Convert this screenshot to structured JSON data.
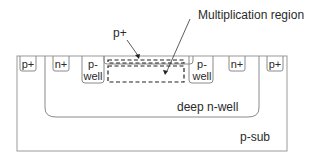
{
  "diagram": {
    "title_annotation": "Multiplication region",
    "top_p_plus_label": "p+",
    "regions": [
      {
        "id": "left-p-plus",
        "label": "p+"
      },
      {
        "id": "left-n-plus",
        "label": "n+"
      },
      {
        "id": "left-p-well",
        "label_line1": "p-",
        "label_line2": "well"
      },
      {
        "id": "right-p-well",
        "label_line1": "p-",
        "label_line2": "well"
      },
      {
        "id": "right-n-plus",
        "label": "n+"
      },
      {
        "id": "right-p-plus",
        "label": "p+"
      }
    ],
    "deep_n_well_label": "deep n-well",
    "p_sub_label": "p-sub",
    "colors": {
      "line": "#8a8a8a",
      "dashed": "#222222",
      "text": "#2a2a2a"
    }
  }
}
